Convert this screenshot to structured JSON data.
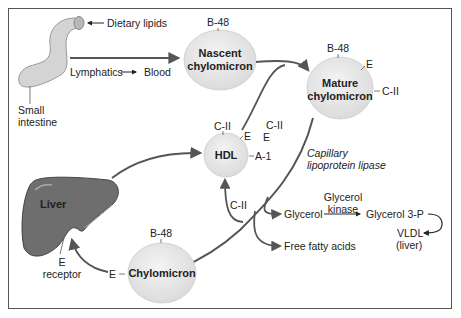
{
  "figure": {
    "small_intestine": {
      "label": "Small intestine",
      "line1": "Small",
      "line2": "intestine"
    },
    "dietary_lipids": "Dietary lipids",
    "lymphatics": "Lymphatics",
    "blood": "Blood",
    "nascent": {
      "line1": "Nascent",
      "line2": "chylomicron",
      "apo": "B-48"
    },
    "mature": {
      "line1": "Mature",
      "line2": "chylomicron",
      "apo_top": "B-48",
      "apo_e": "E",
      "apo_c": "C-II"
    },
    "hdl_transfer": {
      "c2": "C-II",
      "e": "E"
    },
    "hdl": {
      "label": "HDL",
      "c2": "C-II",
      "e": "E",
      "a1": "A-1",
      "return_c2": "C-II"
    },
    "lipase": {
      "line1": "Capillary",
      "line2": "lipoprotein lipase"
    },
    "glycerol": "Glycerol",
    "glycerol_kinase": {
      "line1": "Glycerol",
      "line2": "kinase"
    },
    "glycerol_3p": "Glycerol 3-P",
    "vldl": {
      "line1": "VLDL",
      "line2": "(liver)"
    },
    "ffa": "Free fatty acids",
    "liver": {
      "label": "Liver",
      "receptor_line1": "E",
      "receptor_line2": "receptor"
    },
    "remnant": {
      "label": "Chylomicron",
      "apo_top": "B-48",
      "apo_e": "E"
    }
  },
  "colors": {
    "arrow": "#555555",
    "particle_fill": "#e6e6e6",
    "liver_fill": "#6e6e6e",
    "intestine_fill": "#d4d4d4",
    "border": "#555555"
  }
}
